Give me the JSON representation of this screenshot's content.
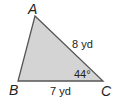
{
  "diagram": {
    "type": "triangle",
    "vertices": {
      "A": {
        "label": "A",
        "x": 35,
        "y": 16
      },
      "B": {
        "label": "B",
        "x": 18,
        "y": 81
      },
      "C": {
        "label": "C",
        "x": 103,
        "y": 81
      }
    },
    "sides": {
      "AC": {
        "label": "8 yd"
      },
      "BC": {
        "label": "7 yd"
      }
    },
    "angles": {
      "C": {
        "label": "44°"
      }
    },
    "colors": {
      "fill": "#d4d4d4",
      "stroke": "#555555"
    }
  }
}
